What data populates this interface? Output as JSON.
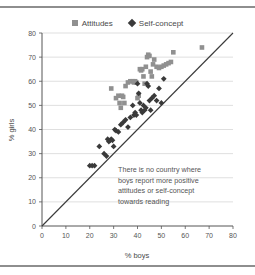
{
  "chart_data": {
    "type": "scatter",
    "title": "",
    "xlabel": "% boys",
    "ylabel": "% girls",
    "xlim": [
      0,
      80
    ],
    "ylim": [
      0,
      80
    ],
    "xticks": [
      0,
      10,
      20,
      30,
      40,
      50,
      60,
      70,
      80
    ],
    "yticks": [
      0,
      10,
      20,
      30,
      40,
      50,
      60,
      70,
      80
    ],
    "grid": true,
    "legend_position": "top-center",
    "annotation": {
      "lines": [
        "There is no country where",
        "boys report more positive",
        "attitudes or self-concept",
        "towards reading"
      ]
    },
    "reference_line": {
      "name": "diagonal-parity-line",
      "from": [
        0,
        0
      ],
      "to": [
        80,
        80
      ]
    },
    "series": [
      {
        "name": "Attitudes",
        "marker": "square",
        "color": "#909090",
        "points": [
          [
            29,
            57
          ],
          [
            31,
            53
          ],
          [
            32,
            54
          ],
          [
            32.5,
            51
          ],
          [
            33,
            49
          ],
          [
            33.5,
            54
          ],
          [
            34,
            53.5
          ],
          [
            34.5,
            51
          ],
          [
            35,
            58
          ],
          [
            36,
            59.5
          ],
          [
            37,
            60
          ],
          [
            38,
            60
          ],
          [
            38.5,
            59.5
          ],
          [
            39,
            60
          ],
          [
            39.5,
            59.5
          ],
          [
            40,
            53
          ],
          [
            40.5,
            54
          ],
          [
            41,
            65
          ],
          [
            41.5,
            64.5
          ],
          [
            42,
            65
          ],
          [
            42.5,
            62
          ],
          [
            43,
            59
          ],
          [
            43.5,
            66
          ],
          [
            44,
            70
          ],
          [
            44.5,
            71
          ],
          [
            45,
            70.5
          ],
          [
            45.5,
            64
          ],
          [
            46,
            62
          ],
          [
            46.5,
            67
          ],
          [
            47,
            69
          ],
          [
            48,
            66
          ],
          [
            49,
            65.5
          ],
          [
            50,
            66
          ],
          [
            51,
            66.5
          ],
          [
            52,
            67
          ],
          [
            53,
            67.5
          ],
          [
            54,
            68
          ],
          [
            55,
            72
          ],
          [
            67,
            74
          ]
        ]
      },
      {
        "name": "Self-concept",
        "marker": "diamond",
        "color": "#3a3a3a",
        "points": [
          [
            20,
            25
          ],
          [
            21,
            25
          ],
          [
            22,
            25
          ],
          [
            24,
            33
          ],
          [
            26,
            30
          ],
          [
            27,
            29
          ],
          [
            27.5,
            36
          ],
          [
            28,
            35
          ],
          [
            28.5,
            35.5
          ],
          [
            29,
            36
          ],
          [
            29.5,
            35.5
          ],
          [
            30,
            33
          ],
          [
            30.5,
            40
          ],
          [
            31,
            39.5
          ],
          [
            32,
            39
          ],
          [
            33,
            42
          ],
          [
            34,
            43
          ],
          [
            35,
            44
          ],
          [
            36,
            41
          ],
          [
            37,
            45
          ],
          [
            38,
            50
          ],
          [
            38.5,
            46
          ],
          [
            39,
            47
          ],
          [
            39.5,
            46
          ],
          [
            40,
            59
          ],
          [
            40.5,
            55
          ],
          [
            41,
            51
          ],
          [
            41.5,
            48
          ],
          [
            42,
            47
          ],
          [
            42.5,
            50
          ],
          [
            43,
            48
          ],
          [
            43.5,
            49
          ],
          [
            44,
            59
          ],
          [
            44.5,
            58
          ],
          [
            45,
            52
          ],
          [
            45.5,
            48
          ],
          [
            46,
            53
          ],
          [
            47,
            54
          ],
          [
            48,
            52
          ],
          [
            49,
            57
          ],
          [
            50,
            51
          ],
          [
            51,
            61
          ]
        ]
      }
    ]
  },
  "legend": {
    "items": [
      {
        "label": "Attitudes",
        "marker": "square"
      },
      {
        "label": "Self-concept",
        "marker": "diamond"
      }
    ]
  }
}
